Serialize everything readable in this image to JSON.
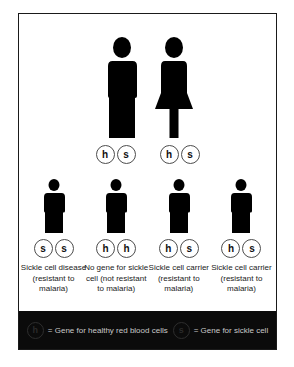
{
  "diagram": {
    "colors": {
      "figure": "#000000",
      "frame": "#1a1a1a",
      "panel_background": "#ffffff",
      "legend_background": "#0b0b0b",
      "legend_text": "#c9c9c9",
      "allele_outline": "#4d4d4d"
    },
    "parents": [
      {
        "sex": "male",
        "icon": "male-figure-icon",
        "alleles": [
          "h",
          "s"
        ]
      },
      {
        "sex": "female",
        "icon": "female-figure-icon",
        "alleles": [
          "h",
          "s"
        ]
      }
    ],
    "children": [
      {
        "icon": "child-figure-icon",
        "alleles": [
          "s",
          "s"
        ],
        "caption": "Sickle cell disease (resistant to malaria)"
      },
      {
        "icon": "child-figure-icon",
        "alleles": [
          "h",
          "h"
        ],
        "caption": "No gene for sickle cell (not resistant to malaria)"
      },
      {
        "icon": "child-figure-icon",
        "alleles": [
          "h",
          "s"
        ],
        "caption": "Sickle cell carrier (resistant to malaria)"
      },
      {
        "icon": "child-figure-icon",
        "alleles": [
          "h",
          "s"
        ],
        "caption": "Sickle cell carrier (resistant to malaria)"
      }
    ],
    "legend": [
      {
        "symbol": "h",
        "text": "= Gene for healthy red blood cells"
      },
      {
        "symbol": "s",
        "text": "= Gene for sickle cell"
      }
    ]
  }
}
